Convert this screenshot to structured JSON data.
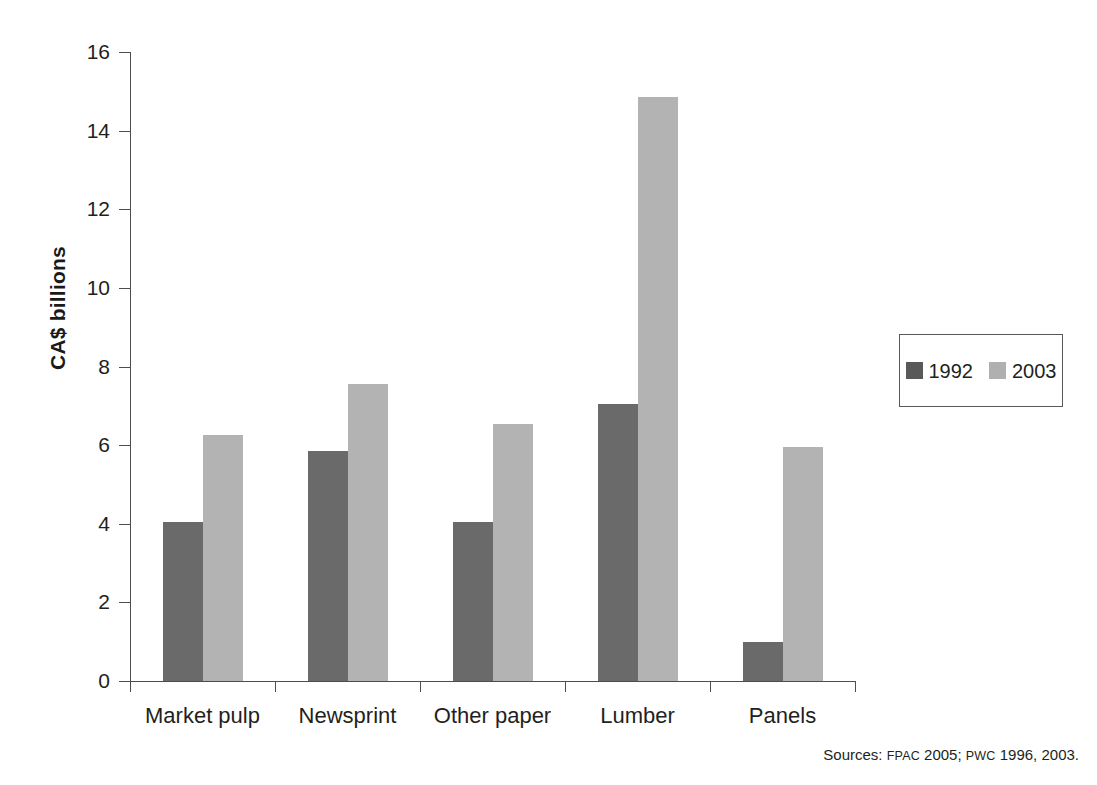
{
  "chart_data": {
    "type": "bar",
    "title": "",
    "xlabel": "",
    "ylabel": "CA$ billions",
    "categories": [
      "Market pulp",
      "Newsprint",
      "Other paper",
      "Lumber",
      "Panels"
    ],
    "series": [
      {
        "name": "1992",
        "color": "#6a6a6a",
        "values": [
          4.05,
          5.85,
          4.05,
          7.05,
          1.0
        ]
      },
      {
        "name": "2003",
        "color": "#b3b3b3",
        "values": [
          6.25,
          7.55,
          6.55,
          14.85,
          5.95
        ]
      }
    ],
    "ylim": [
      0,
      16
    ],
    "yticks": [
      0,
      2,
      4,
      6,
      8,
      10,
      12,
      14,
      16
    ],
    "ytick_labels": [
      "0",
      "2",
      "4",
      "6",
      "8",
      "10",
      "12",
      "14",
      "16"
    ],
    "grid": false,
    "legend_position": "right"
  },
  "legend": {
    "entries": [
      {
        "label": "1992",
        "swatch": "series-1992-swatch"
      },
      {
        "label": "2003",
        "swatch": "series-2003-swatch"
      }
    ]
  },
  "source_note": {
    "prefix": "Sources:",
    "acronym_1": "FPAC",
    "year_1": "2005;",
    "acronym_2": "PWC",
    "year_2": "1996, 2003."
  }
}
